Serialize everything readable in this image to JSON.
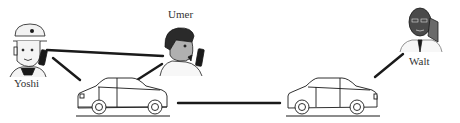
{
  "diagram": {
    "type": "network",
    "nodes": [
      {
        "id": "yoshi",
        "label": "Yoshi",
        "kind": "person",
        "icon": "person-with-cap-and-phone-icon"
      },
      {
        "id": "umer",
        "label": "Umer",
        "kind": "person",
        "icon": "person-with-phone-icon"
      },
      {
        "id": "walt",
        "label": "Walt",
        "kind": "person",
        "icon": "person-on-phone-icon"
      },
      {
        "id": "car1",
        "label": "",
        "kind": "vehicle",
        "icon": "car-icon"
      },
      {
        "id": "car2",
        "label": "",
        "kind": "vehicle",
        "icon": "car-icon"
      }
    ],
    "edges": [
      {
        "from": "yoshi",
        "to": "umer"
      },
      {
        "from": "yoshi",
        "to": "car1"
      },
      {
        "from": "umer",
        "to": "car1"
      },
      {
        "from": "car1",
        "to": "car2"
      },
      {
        "from": "car2",
        "to": "walt"
      }
    ],
    "colors": {
      "line": "#1a1a1a",
      "skin_light": "#f0f0f0",
      "skin_umer": "#b0b0b0",
      "skin_walt": "#4a4a4a",
      "hair": "#2a2a2a"
    }
  }
}
